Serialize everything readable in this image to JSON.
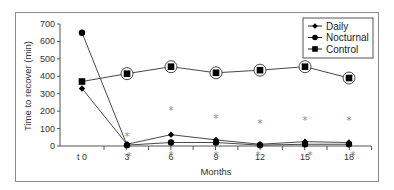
{
  "chart_data": {
    "type": "line",
    "title": "",
    "xlabel": "Months",
    "ylabel": "Time to recover (min)",
    "categories": [
      "t 0",
      "3",
      "6",
      "9",
      "12",
      "15",
      "18"
    ],
    "ylim": [
      0,
      700
    ],
    "yticks": [
      0,
      100,
      200,
      300,
      400,
      500,
      600,
      700
    ],
    "grid": false,
    "legend_position": "top-right",
    "series": [
      {
        "name": "Daily",
        "marker": "diamond",
        "values": [
          330,
          10,
          65,
          35,
          10,
          25,
          20
        ]
      },
      {
        "name": "Nocturnal",
        "marker": "circle",
        "values": [
          650,
          5,
          20,
          20,
          5,
          10,
          10
        ]
      },
      {
        "name": "Control",
        "marker": "square",
        "values": [
          370,
          415,
          455,
          420,
          435,
          455,
          390
        ]
      }
    ],
    "annotations": "Control points circled from month 3 onward; asterisks (*) mark significant differences above and below points at months 3-18"
  },
  "legend": {
    "items": [
      "Daily",
      "Nocturnal",
      "Control"
    ]
  }
}
